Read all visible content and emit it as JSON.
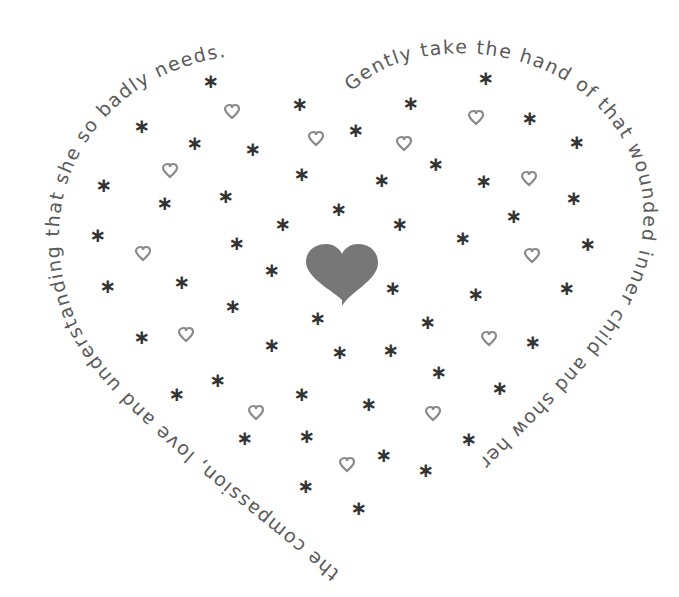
{
  "illustration": {
    "title": "Heart of stars and hearts with encircling message",
    "colors": {
      "background": "#ffffff",
      "text": "#5a5a5a",
      "asterisk": "#333333",
      "small_heart_outline": "#8a8a8a",
      "center_heart_fill": "#777777"
    },
    "message": {
      "full": "Gently take the hand of that wounded inner child and show her the compassion, love and understanding that she so badly needs.",
      "segment_right": "Gently take the hand of that wounded inner child and show her",
      "segment_left": "the compassion, love and understanding that she so badly needs."
    },
    "center_heart": {
      "x": 342,
      "y": 270,
      "symbol": "heart-filled"
    },
    "asterisks": [
      {
        "x": 211,
        "y": 81
      },
      {
        "x": 486,
        "y": 78
      },
      {
        "x": 142,
        "y": 126
      },
      {
        "x": 300,
        "y": 104
      },
      {
        "x": 411,
        "y": 103
      },
      {
        "x": 195,
        "y": 143
      },
      {
        "x": 253,
        "y": 149
      },
      {
        "x": 356,
        "y": 130
      },
      {
        "x": 530,
        "y": 118
      },
      {
        "x": 577,
        "y": 142
      },
      {
        "x": 104,
        "y": 185
      },
      {
        "x": 165,
        "y": 203
      },
      {
        "x": 226,
        "y": 196
      },
      {
        "x": 302,
        "y": 174
      },
      {
        "x": 382,
        "y": 180
      },
      {
        "x": 436,
        "y": 164
      },
      {
        "x": 484,
        "y": 181
      },
      {
        "x": 574,
        "y": 198
      },
      {
        "x": 98,
        "y": 235
      },
      {
        "x": 237,
        "y": 243
      },
      {
        "x": 283,
        "y": 224
      },
      {
        "x": 339,
        "y": 209
      },
      {
        "x": 400,
        "y": 224
      },
      {
        "x": 463,
        "y": 238
      },
      {
        "x": 514,
        "y": 216
      },
      {
        "x": 588,
        "y": 244
      },
      {
        "x": 108,
        "y": 286
      },
      {
        "x": 182,
        "y": 282
      },
      {
        "x": 272,
        "y": 270
      },
      {
        "x": 393,
        "y": 288
      },
      {
        "x": 476,
        "y": 294
      },
      {
        "x": 567,
        "y": 288
      },
      {
        "x": 233,
        "y": 306
      },
      {
        "x": 318,
        "y": 318
      },
      {
        "x": 428,
        "y": 322
      },
      {
        "x": 142,
        "y": 337
      },
      {
        "x": 272,
        "y": 345
      },
      {
        "x": 340,
        "y": 352
      },
      {
        "x": 391,
        "y": 350
      },
      {
        "x": 533,
        "y": 342
      },
      {
        "x": 439,
        "y": 372
      },
      {
        "x": 218,
        "y": 380
      },
      {
        "x": 177,
        "y": 394
      },
      {
        "x": 302,
        "y": 394
      },
      {
        "x": 369,
        "y": 404
      },
      {
        "x": 500,
        "y": 388
      },
      {
        "x": 245,
        "y": 438
      },
      {
        "x": 307,
        "y": 436
      },
      {
        "x": 469,
        "y": 439
      },
      {
        "x": 384,
        "y": 455
      },
      {
        "x": 426,
        "y": 470
      },
      {
        "x": 306,
        "y": 486
      },
      {
        "x": 359,
        "y": 508
      }
    ],
    "small_hearts": [
      {
        "x": 232,
        "y": 112
      },
      {
        "x": 476,
        "y": 118
      },
      {
        "x": 316,
        "y": 139
      },
      {
        "x": 404,
        "y": 144
      },
      {
        "x": 170,
        "y": 171
      },
      {
        "x": 529,
        "y": 179
      },
      {
        "x": 143,
        "y": 254
      },
      {
        "x": 532,
        "y": 256
      },
      {
        "x": 186,
        "y": 335
      },
      {
        "x": 489,
        "y": 339
      },
      {
        "x": 256,
        "y": 413
      },
      {
        "x": 433,
        "y": 414
      },
      {
        "x": 347,
        "y": 465
      }
    ]
  }
}
